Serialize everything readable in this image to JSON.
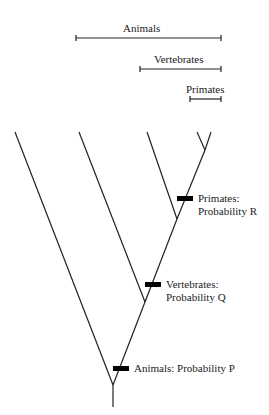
{
  "diagram": {
    "type": "phylogenetic-tree",
    "ranges": [
      {
        "label": "Animals"
      },
      {
        "label": "Vertebrates"
      },
      {
        "label": "Primates"
      }
    ],
    "nodes": [
      {
        "label_line1": "Primates:",
        "label_line2": "Probability R"
      },
      {
        "label_line1": "Vertebrates:",
        "label_line2": "Probability Q"
      },
      {
        "label_line1": "Animals: Probability P"
      }
    ]
  }
}
